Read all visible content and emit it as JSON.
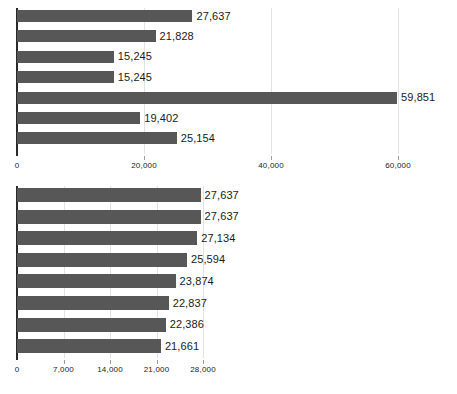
{
  "chart_data": [
    {
      "id": "top",
      "type": "bar",
      "orientation": "horizontal",
      "title": "",
      "subtitle": "",
      "xlabel": "",
      "ylabel": "",
      "grid": true,
      "legend": false,
      "xlim": [
        0,
        66000
      ],
      "categories": [
        "",
        "",
        "",
        "",
        "",
        "",
        ""
      ],
      "values": [
        27637,
        21828,
        15245,
        15245,
        59851,
        19402,
        25154
      ],
      "data_labels": [
        "27,637",
        "21,828",
        "15,245",
        "15,245",
        "59,851",
        "19,402",
        "25,154"
      ],
      "ticks": [
        0,
        20000,
        40000,
        60000
      ],
      "tick_labels": [
        "0",
        "20,000",
        "40,000",
        "60,000"
      ],
      "bar_color": "#575757"
    },
    {
      "id": "bottom",
      "type": "bar",
      "orientation": "horizontal",
      "title": "",
      "subtitle": "",
      "xlabel": "",
      "ylabel": "",
      "grid": true,
      "legend": false,
      "xlim": [
        0,
        30000
      ],
      "categories": [
        "",
        "",
        "",
        "",
        "",
        "",
        "",
        ""
      ],
      "values": [
        27637,
        27637,
        27134,
        25594,
        23874,
        22837,
        22386,
        21661
      ],
      "data_labels": [
        "27,637",
        "27,637",
        "27,134",
        "25,594",
        "23,874",
        "22,837",
        "22,386",
        "21,661"
      ],
      "ticks": [
        0,
        7000,
        14000,
        21000,
        28000
      ],
      "tick_labels": [
        "0",
        "7,000",
        "14,000",
        "21,000",
        "28,000"
      ],
      "bar_color": "#575757"
    }
  ]
}
